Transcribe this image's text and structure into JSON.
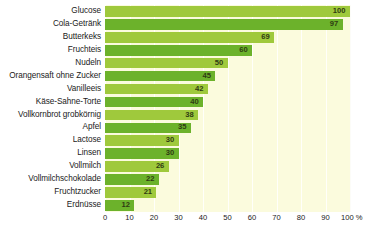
{
  "chart_data": {
    "type": "bar",
    "orientation": "horizontal",
    "title": "",
    "xlabel": "%",
    "ylabel": "",
    "xlim": [
      0,
      100
    ],
    "grid": true,
    "legend": null,
    "categories": [
      "Glucose",
      "Cola-Getränk",
      "Butterkeks",
      "Fruchteis",
      "Nudeln",
      "Orangensaft ohne Zucker",
      "Vanilleeis",
      "Käse-Sahne-Torte",
      "Vollkornbrot grobkörnig",
      "Apfel",
      "Lactose",
      "Linsen",
      "Vollmilch",
      "Vollmilchschokolade",
      "Fruchtzucker",
      "Erdnüsse"
    ],
    "values": [
      100,
      97,
      69,
      60,
      50,
      45,
      42,
      40,
      38,
      35,
      30,
      30,
      26,
      22,
      21,
      12
    ],
    "value_labels": [
      "100",
      "97",
      "69",
      "60",
      "50",
      "45",
      "42",
      "40",
      "38",
      "35",
      "30",
      "30",
      "26",
      "22",
      "21",
      "12"
    ],
    "xticks": [
      0,
      10,
      20,
      30,
      40,
      50,
      60,
      70,
      80,
      90,
      100
    ],
    "xtick_labels": [
      "0",
      "10",
      "20",
      "30",
      "40",
      "50",
      "60",
      "70",
      "80",
      "90",
      "100 %"
    ],
    "colors": {
      "bar_light": "#9fc93c",
      "bar_dark": "#6cb22b",
      "plot_background": "#fbfbdd",
      "gridline": "#ffffff",
      "value_text": "#2f3b12",
      "label_text": "#1a1a1a",
      "page_background": "#ffffff"
    }
  }
}
